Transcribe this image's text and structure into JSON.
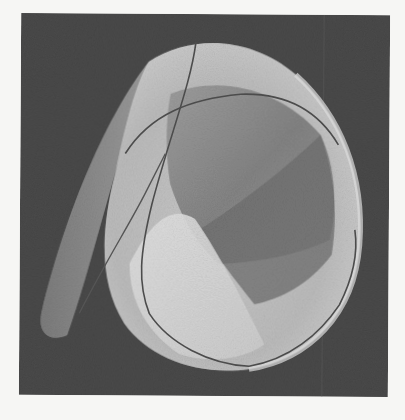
{
  "figure": {
    "colors": {
      "page_background": "#f6f6f4",
      "frame_background": "#4a4a4a",
      "surface_light": "#d9d9d9",
      "surface_mid": "#a8a8a8",
      "surface_dark": "#6e6e6e",
      "curve_line": "#4c4c4c"
    }
  }
}
